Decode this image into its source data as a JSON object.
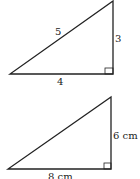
{
  "triangles": [
    {
      "hypotenuse": "5",
      "vertical_leg": "3",
      "horizontal_leg": "4"
    },
    {
      "vertical_leg": "6 cm",
      "horizontal_leg": "8 cm"
    }
  ],
  "colors": {
    "stroke": "#222222"
  }
}
